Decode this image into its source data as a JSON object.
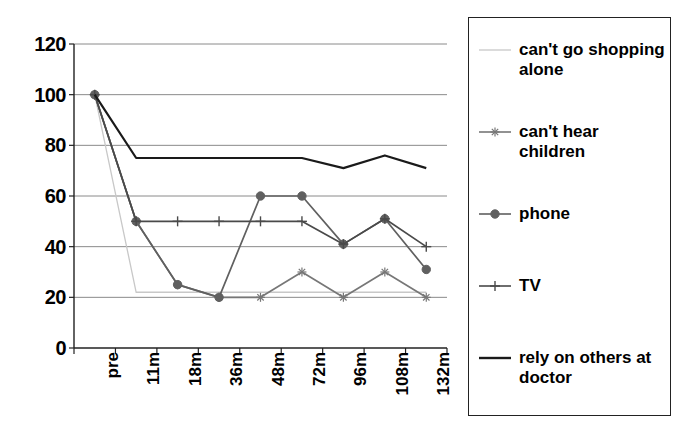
{
  "chart_data": {
    "type": "line",
    "title": "",
    "xlabel": "",
    "ylabel": "",
    "ylim": [
      0,
      120
    ],
    "yticks": [
      0,
      20,
      40,
      60,
      80,
      100,
      120
    ],
    "grid": true,
    "legend_position": "right",
    "categories": [
      "pre",
      "11m",
      "18m",
      "36m",
      "48m",
      "72m",
      "96m",
      "108m",
      "132m"
    ],
    "series": [
      {
        "name": "can't go shopping alone",
        "marker": "none",
        "color": "#c8c8c8",
        "values": [
          100,
          22,
          22,
          22,
          22,
          22,
          22,
          22,
          22
        ]
      },
      {
        "name": "can't hear children",
        "marker": "star",
        "color": "#777777",
        "values": [
          100,
          50,
          25,
          20,
          20,
          30,
          20,
          30,
          20
        ]
      },
      {
        "name": "phone",
        "marker": "circle",
        "color": "#606060",
        "values": [
          100,
          50,
          25,
          20,
          60,
          60,
          41,
          51,
          31
        ]
      },
      {
        "name": "TV",
        "marker": "plus",
        "color": "#4a4a4a",
        "values": [
          100,
          50,
          50,
          50,
          50,
          50,
          41,
          51,
          40
        ]
      },
      {
        "name": "rely on others at doctor",
        "marker": "none",
        "color": "#1a1a1a",
        "values": [
          100,
          75,
          75,
          75,
          75,
          75,
          71,
          76,
          71
        ]
      }
    ]
  },
  "legend": {
    "entries": [
      {
        "label": "can't go shopping alone",
        "marker": "none",
        "color": "#c8c8c8"
      },
      {
        "label": "can't hear children",
        "marker": "star",
        "color": "#777777"
      },
      {
        "label": "phone",
        "marker": "circle",
        "color": "#606060"
      },
      {
        "label": "TV",
        "marker": "plus",
        "color": "#4a4a4a"
      },
      {
        "label": "rely on others at doctor",
        "marker": "none",
        "color": "#1a1a1a"
      }
    ]
  },
  "axes": {
    "y_tick_labels": [
      "120",
      "100",
      "80",
      "60",
      "40",
      "20",
      "0"
    ],
    "x_tick_labels": [
      "pre",
      "11m",
      "18m",
      "36m",
      "48m",
      "72m",
      "96m",
      "108m",
      "132m"
    ]
  }
}
